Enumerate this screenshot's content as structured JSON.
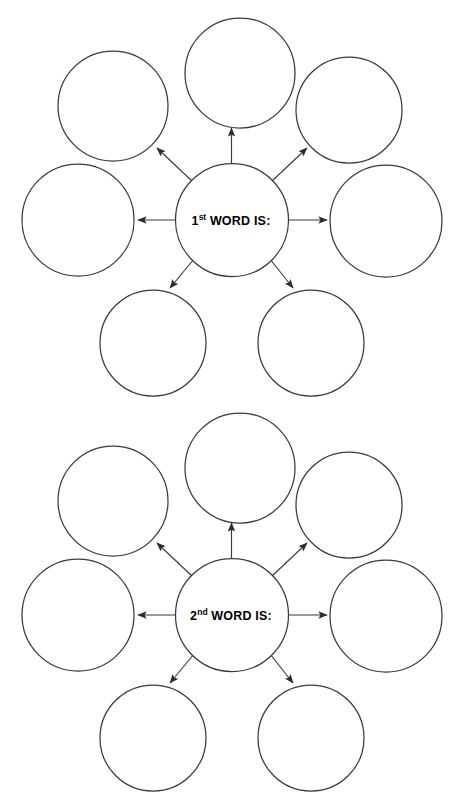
{
  "page": {
    "background_color": "#ffffff",
    "line_color": "#3a3a3a",
    "text_color": "#000000",
    "width": 467,
    "height": 800
  },
  "organizers": [
    {
      "id": "first-word-web",
      "center": {
        "number": "1",
        "ordinal_suffix": "st",
        "label_rest": " WORD IS:",
        "full_text": "1st WORD IS:"
      },
      "branch_count": 6,
      "branches": [
        {
          "name": "branch-top",
          "direction": "up",
          "filled": false,
          "value": ""
        },
        {
          "name": "branch-top-right",
          "direction": "up-right",
          "filled": false,
          "value": ""
        },
        {
          "name": "branch-right",
          "direction": "right",
          "filled": false,
          "value": ""
        },
        {
          "name": "branch-bottom-right",
          "direction": "down-right",
          "filled": false,
          "value": ""
        },
        {
          "name": "branch-bottom-left",
          "direction": "down-left",
          "filled": false,
          "value": ""
        },
        {
          "name": "branch-left",
          "direction": "left",
          "filled": false,
          "value": ""
        },
        {
          "name": "branch-top-left",
          "direction": "up-left",
          "filled": false,
          "value": ""
        }
      ]
    },
    {
      "id": "second-word-web",
      "center": {
        "number": "2",
        "ordinal_suffix": "nd",
        "label_rest": " WORD IS:",
        "full_text": "2nd WORD IS:"
      },
      "branch_count": 6,
      "branches": [
        {
          "name": "branch-top",
          "direction": "up",
          "filled": false,
          "value": ""
        },
        {
          "name": "branch-top-right",
          "direction": "up-right",
          "filled": false,
          "value": ""
        },
        {
          "name": "branch-right",
          "direction": "right",
          "filled": false,
          "value": ""
        },
        {
          "name": "branch-bottom-right",
          "direction": "down-right",
          "filled": false,
          "value": ""
        },
        {
          "name": "branch-bottom-left",
          "direction": "down-left",
          "filled": false,
          "value": ""
        },
        {
          "name": "branch-left",
          "direction": "left",
          "filled": false,
          "value": ""
        },
        {
          "name": "branch-top-left",
          "direction": "up-left",
          "filled": false,
          "value": ""
        }
      ]
    }
  ]
}
